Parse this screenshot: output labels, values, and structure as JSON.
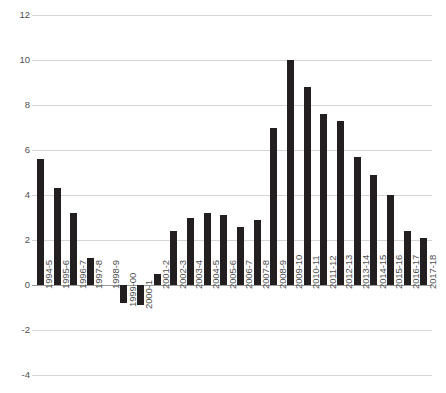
{
  "chart_data": {
    "type": "bar",
    "title": "",
    "subtitle": "",
    "xlabel": "",
    "ylabel": "",
    "ylim": [
      -4,
      12
    ],
    "yticks": [
      12,
      10,
      8,
      6,
      4,
      2,
      0,
      -2,
      -4
    ],
    "ytick_labels": [
      "12",
      "10",
      "8",
      "6",
      "4",
      "2",
      "0",
      "-2",
      "-4"
    ],
    "grid": true,
    "legend": false,
    "legend_position": "none",
    "bar_color": "#231f20",
    "gridline_color": "#d6d6d6",
    "background_color": "#ffffff",
    "categories": [
      "1994-5",
      "1995-6",
      "1996-7",
      "1997-8",
      "1998-9",
      "1999-00",
      "2000-1",
      "2001-2",
      "2002-3",
      "2003-4",
      "2004-5",
      "2005-6",
      "2006-7",
      "2007-8",
      "2008-9",
      "2009-10",
      "2010-11",
      "2011-12",
      "2012-13",
      "2013-14",
      "2014-15",
      "2015-16",
      "2016-17",
      "2017-18"
    ],
    "values": [
      5.6,
      4.3,
      3.2,
      1.2,
      0.0,
      -0.8,
      -0.9,
      0.5,
      2.4,
      3.0,
      3.2,
      3.1,
      2.6,
      2.9,
      7.0,
      10.0,
      8.8,
      7.6,
      7.3,
      5.7,
      4.9,
      4.0,
      2.4,
      2.1
    ]
  }
}
